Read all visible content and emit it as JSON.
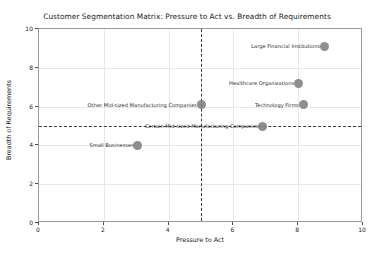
{
  "chart_data": {
    "type": "scatter",
    "title": "Customer Segmentation Matrix: Pressure to Act vs. Breadth of Requirements",
    "xlabel": "Pressure to Act",
    "ylabel": "Breadth of Requirements",
    "xlim": [
      0,
      10
    ],
    "ylim": [
      0,
      10
    ],
    "xticks": [
      0,
      2,
      4,
      6,
      8,
      10
    ],
    "yticks": [
      0,
      2,
      4,
      6,
      8,
      10
    ],
    "grid": true,
    "legend": "none",
    "marker_color": "#7f7f7f",
    "reference_lines": {
      "vertical_x": 5,
      "horizontal_y": 5,
      "style": "dashed",
      "color": "#3a3a3a"
    },
    "points": [
      {
        "label": "Large Financial Institutions",
        "x": 8.8,
        "y": 9.1
      },
      {
        "label": "Healthcare Organizations",
        "x": 8.0,
        "y": 7.2
      },
      {
        "label": "Technology Firms",
        "x": 8.15,
        "y": 6.1
      },
      {
        "label": "Other Mid-sized Manufacturing Companies",
        "x": 5.0,
        "y": 6.1
      },
      {
        "label": "Certain Mid-sized Manufacturing Companies",
        "x": 6.9,
        "y": 5.0
      },
      {
        "label": "Small Businesses",
        "x": 3.05,
        "y": 4.0
      }
    ]
  }
}
